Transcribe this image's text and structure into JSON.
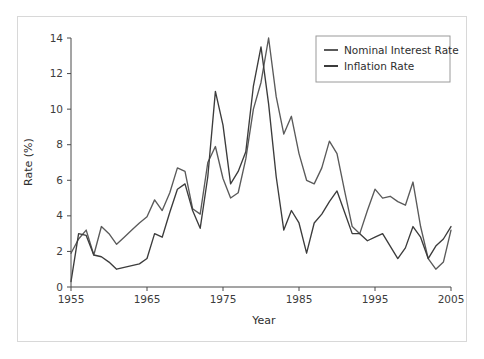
{
  "figure": {
    "background_color": "#ffffff",
    "frame_color": "#d8d8d8",
    "plot_background": "#ffffff"
  },
  "chart_data": {
    "type": "line",
    "title": "",
    "xlabel": "Year",
    "ylabel": "Rate (%)",
    "xlim": [
      1955,
      2005
    ],
    "ylim": [
      0,
      14
    ],
    "xticks": [
      1955,
      1965,
      1975,
      1985,
      1995,
      2005
    ],
    "yticks": [
      0,
      2,
      4,
      6,
      8,
      10,
      12,
      14
    ],
    "grid": false,
    "legend_position": "upper right",
    "x": [
      1955,
      1956,
      1957,
      1958,
      1959,
      1960,
      1961,
      1962,
      1963,
      1964,
      1965,
      1966,
      1967,
      1968,
      1969,
      1970,
      1971,
      1972,
      1973,
      1974,
      1975,
      1976,
      1977,
      1978,
      1979,
      1980,
      1981,
      1982,
      1983,
      1984,
      1985,
      1986,
      1987,
      1988,
      1989,
      1990,
      1991,
      1992,
      1993,
      1994,
      1995,
      1996,
      1997,
      1998,
      1999,
      2000,
      2001,
      2002,
      2003,
      2004,
      2005
    ],
    "series": [
      {
        "name": "Nominal Interest Rate",
        "color": "#5a5a5a",
        "values": [
          1.9,
          2.7,
          3.2,
          1.8,
          3.4,
          3.0,
          2.4,
          2.8,
          3.2,
          3.6,
          3.95,
          4.9,
          4.3,
          5.3,
          6.7,
          6.5,
          4.4,
          4.1,
          7.0,
          7.9,
          6.1,
          5.0,
          5.3,
          7.2,
          10.0,
          11.5,
          14.0,
          10.7,
          8.6,
          9.6,
          7.5,
          6.0,
          5.8,
          6.7,
          8.2,
          7.5,
          5.4,
          3.4,
          3.0,
          4.3,
          5.5,
          5.0,
          5.1,
          4.8,
          4.6,
          5.9,
          3.4,
          1.6,
          1.0,
          1.4,
          3.2
        ]
      },
      {
        "name": "Inflation Rate",
        "color": "#3c3c3c",
        "values": [
          0.3,
          3.0,
          2.9,
          1.8,
          1.7,
          1.4,
          1.0,
          1.1,
          1.2,
          1.3,
          1.6,
          3.0,
          2.8,
          4.2,
          5.5,
          5.8,
          4.3,
          3.3,
          6.2,
          11.0,
          9.1,
          5.8,
          6.5,
          7.6,
          11.3,
          13.5,
          10.3,
          6.2,
          3.2,
          4.3,
          3.6,
          1.9,
          3.6,
          4.1,
          4.8,
          5.4,
          4.2,
          3.0,
          3.0,
          2.6,
          2.8,
          3.0,
          2.3,
          1.6,
          2.2,
          3.4,
          2.8,
          1.6,
          2.3,
          2.7,
          3.4
        ]
      }
    ]
  },
  "legend": {
    "items": [
      {
        "label": "Nominal Interest Rate",
        "color": "#5a5a5a"
      },
      {
        "label": "Inflation Rate",
        "color": "#3c3c3c"
      }
    ]
  },
  "axes": {
    "x_tick_labels": [
      "1955",
      "1965",
      "1975",
      "1985",
      "1995",
      "2005"
    ],
    "y_tick_labels": [
      "0",
      "2",
      "4",
      "6",
      "8",
      "10",
      "12",
      "14"
    ],
    "x_axis_title": "Year",
    "y_axis_title": "Rate (%)"
  }
}
